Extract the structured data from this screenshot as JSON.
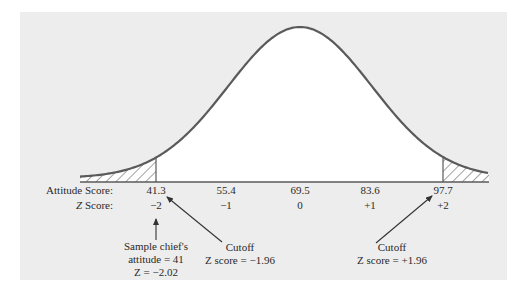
{
  "figure": {
    "colors": {
      "panel_bg": "#ededed",
      "curve_fill": "#ffffff",
      "curve_stroke": "#5a5a5a",
      "hatch": "#8a8a8a",
      "text": "#2a2a2a",
      "arrow": "#333333"
    },
    "row_labels": {
      "attitude": "Attitude Score:",
      "z": "Z Score:",
      "z_letter": "Z"
    },
    "attitude_scores": [
      "41.3",
      "55.4",
      "69.5",
      "83.6",
      "97.7"
    ],
    "z_scores": [
      "−2",
      "−1",
      "0",
      "+1",
      "+2"
    ],
    "annotations": {
      "sample": {
        "line1": "Sample chief's",
        "line2": "attitude = 41",
        "line3": "Z = −2.02"
      },
      "cutoff_left": {
        "line1": "Cutoff",
        "line2": "Z score = −1.96"
      },
      "cutoff_right": {
        "line1": "Cutoff",
        "line2": "Z score = +1.96"
      }
    }
  },
  "chart_data": {
    "type": "area",
    "mean": 69.5,
    "sd": 14.1,
    "x_ticks_attitude": [
      41.3,
      55.4,
      69.5,
      83.6,
      97.7
    ],
    "x_ticks_z": [
      -2,
      -1,
      0,
      1,
      2
    ],
    "shaded_regions": [
      {
        "from_z": "-inf",
        "to_z": -1.96,
        "label": "Cutoff Z score = -1.96"
      },
      {
        "from_z": 1.96,
        "to_z": "+inf",
        "label": "Cutoff Z score = +1.96"
      }
    ],
    "marked_point": {
      "attitude": 41,
      "z": -2.02,
      "label": "Sample chief's attitude"
    },
    "xlabel": "Attitude Score / Z Score",
    "ylabel": ""
  }
}
